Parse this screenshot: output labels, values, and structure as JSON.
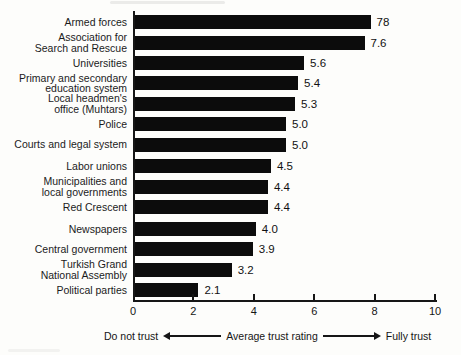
{
  "chart_data": {
    "type": "bar",
    "orientation": "horizontal",
    "title": "",
    "xlabel": "Average trust rating",
    "xlim": [
      0,
      10
    ],
    "grid": false,
    "bar_color": "#0c0c0c",
    "background_color": "#fdfdfb",
    "categories": [
      "Armed forces",
      "Association for Search and Rescue",
      "Universities",
      "Primary and secondary education system",
      "Local headmen's office (Muhtars)",
      "Police",
      "Courts and legal system",
      "Labor unions",
      "Municipalities and local governments",
      "Red Crescent",
      "Newspapers",
      "Central government",
      "Turkish Grand National Assembly",
      "Political parties"
    ],
    "values": [
      7.8,
      7.6,
      5.6,
      5.4,
      5.3,
      5.0,
      5.0,
      4.5,
      4.4,
      4.4,
      4.0,
      3.9,
      3.2,
      2.1
    ],
    "rows": [
      {
        "label_lines": [
          "Armed forces"
        ],
        "value": 7.8,
        "display": "78",
        "group_start": false
      },
      {
        "label_lines": [
          "Association for",
          "Search and Rescue"
        ],
        "value": 7.6,
        "display": "7.6",
        "group_start": false
      },
      {
        "label_lines": [
          "Universities"
        ],
        "value": 5.6,
        "display": "5.6",
        "group_start": false
      },
      {
        "label_lines": [
          "Primary and secondary",
          "education system"
        ],
        "value": 5.4,
        "display": "5.4",
        "group_start": false
      },
      {
        "label_lines": [
          "Local headmen's",
          "office (Muhtars)"
        ],
        "value": 5.3,
        "display": "5.3",
        "group_start": false
      },
      {
        "label_lines": [
          "Police"
        ],
        "value": 5.0,
        "display": "5.0",
        "group_start": false
      },
      {
        "label_lines": [
          "Courts and legal system"
        ],
        "value": 5.0,
        "display": "5.0",
        "group_start": false
      },
      {
        "label_lines": [
          "Labor unions"
        ],
        "value": 4.5,
        "display": "4.5",
        "group_start": true
      },
      {
        "label_lines": [
          "Municipalities and",
          "local governments"
        ],
        "value": 4.4,
        "display": "4.4",
        "group_start": false
      },
      {
        "label_lines": [
          "Red Crescent"
        ],
        "value": 4.4,
        "display": "4.4",
        "group_start": false
      },
      {
        "label_lines": [
          "Newspapers"
        ],
        "value": 4.0,
        "display": "4.0",
        "group_start": true
      },
      {
        "label_lines": [
          "Central government"
        ],
        "value": 3.9,
        "display": "3.9",
        "group_start": false
      },
      {
        "label_lines": [
          "Turkish Grand",
          "National Assembly"
        ],
        "value": 3.2,
        "display": "3.2",
        "group_start": false
      },
      {
        "label_lines": [
          "Political parties"
        ],
        "value": 2.1,
        "display": "2.1",
        "group_start": false
      }
    ],
    "x_axis": {
      "ticks": [
        "0",
        "2",
        "4",
        "6",
        "8",
        "10"
      ],
      "tick_values": [
        0,
        2,
        4,
        6,
        8,
        10
      ],
      "min_label": "Do not trust",
      "axis_label": "Average trust rating",
      "max_label": "Fully trust"
    }
  }
}
